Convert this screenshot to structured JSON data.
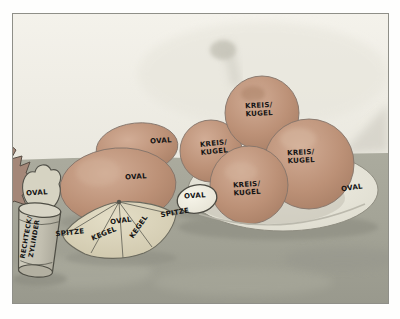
{
  "artwork": {
    "annotations": {
      "cup_fruit": "OVAL",
      "cup": "RECHTECK/\nZYLINDER",
      "spitze_left": "SPITZE",
      "kegel_left": "KEGEL",
      "lemon_top": "OVAL",
      "kegel_right": "KEGEL",
      "spitze_right": "SPITZE",
      "orange_upper": "OVAL",
      "orange_lower": "OVAL",
      "egg": "OVAL",
      "fruit_top": "KREIS/\nKUGEL",
      "fruit_left": "KREIS/\nKUGEL",
      "fruit_right": "KREIS/\nKUGEL",
      "fruit_bottom": "KREIS/\nKUGEL",
      "plate": "OVAL"
    },
    "palette": {
      "paper": "#ffffff",
      "wall": "#f0eee7",
      "table": "#a5a598",
      "fruit": "#bc9177",
      "lemon": "#d8d1b8",
      "plate": "#eceade",
      "egg": "#f4f2e6",
      "cup": "#c6c3b4",
      "ink": "#141414"
    }
  }
}
